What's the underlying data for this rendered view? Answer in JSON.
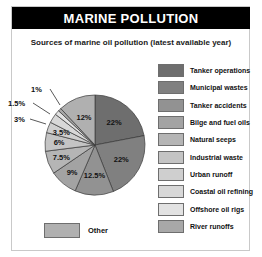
{
  "header": {
    "title": "MARINE POLLUTION"
  },
  "subtitle": "Sources of marine oil pollution (latest available year)",
  "other_legend": {
    "label": "Other",
    "color": "#b0b0b0"
  },
  "legend": {
    "items": [
      {
        "label": "Tanker operations",
        "color": "#6e6e6e"
      },
      {
        "label": "Municipal wastes",
        "color": "#808080"
      },
      {
        "label": "Tanker accidents",
        "color": "#929292"
      },
      {
        "label": "Bilge and fuel oils",
        "color": "#a3a3a3"
      },
      {
        "label": "Natural seeps",
        "color": "#b5b5b5"
      },
      {
        "label": "Industrial waste",
        "color": "#c4c4c4"
      },
      {
        "label": "Urban runoff",
        "color": "#cfcfcf"
      },
      {
        "label": "Coastal oil refining",
        "color": "#d8d8d8"
      },
      {
        "label": "Offshore oil rigs",
        "color": "#e2e2e2"
      },
      {
        "label": "River runoffs",
        "color": "#a8a8a8"
      }
    ]
  },
  "chart_data": {
    "type": "pie",
    "title": "MARINE POLLUTION",
    "subtitle": "Sources of marine oil pollution (latest available year)",
    "unit": "percent",
    "legend_position": "right",
    "start_angle_deg": 0,
    "direction": "clockwise",
    "categories": [
      "Tanker operations",
      "Municipal wastes",
      "Tanker accidents",
      "Bilge and fuel oils",
      "Natural seeps",
      "Industrial waste",
      "Urban runoff",
      "Coastal oil refining",
      "Offshore oil rigs",
      "River runoffs",
      "Other"
    ],
    "values": [
      22,
      22,
      12.5,
      9,
      7.5,
      6,
      3.5,
      3,
      1.5,
      1,
      12
    ],
    "labels": [
      "22%",
      "22%",
      "12.5%",
      "9%",
      "7.5%",
      "6%",
      "3.5%",
      "3%",
      "1.5%",
      "1%",
      "12%"
    ],
    "colors": [
      "#6e6e6e",
      "#808080",
      "#929292",
      "#a3a3a3",
      "#b5b5b5",
      "#c4c4c4",
      "#cfcfcf",
      "#d8d8d8",
      "#e2e2e2",
      "#a8a8a8",
      "#b0b0b0"
    ],
    "slices": [
      {
        "name": "Tanker operations",
        "value": 22,
        "label": "22%",
        "color": "#6e6e6e",
        "leader": false
      },
      {
        "name": "Municipal wastes",
        "value": 22,
        "label": "22%",
        "color": "#808080",
        "leader": false
      },
      {
        "name": "Tanker accidents",
        "value": 12.5,
        "label": "12.5%",
        "color": "#929292",
        "leader": false
      },
      {
        "name": "Bilge and fuel oils",
        "value": 9,
        "label": "9%",
        "color": "#a3a3a3",
        "leader": false
      },
      {
        "name": "Natural seeps",
        "value": 7.5,
        "label": "7.5%",
        "color": "#b5b5b5",
        "leader": false
      },
      {
        "name": "Industrial waste",
        "value": 6,
        "label": "6%",
        "color": "#c4c4c4",
        "leader": false
      },
      {
        "name": "Urban runoff",
        "value": 3.5,
        "label": "3.5%",
        "color": "#cfcfcf",
        "leader": false
      },
      {
        "name": "Coastal oil refining",
        "value": 3,
        "label": "3%",
        "color": "#d8d8d8",
        "leader": true
      },
      {
        "name": "Offshore oil rigs",
        "value": 1.5,
        "label": "1.5%",
        "color": "#e2e2e2",
        "leader": true
      },
      {
        "name": "River runoffs",
        "value": 1,
        "label": "1%",
        "color": "#a8a8a8",
        "leader": true
      },
      {
        "name": "Other",
        "value": 12,
        "label": "12%",
        "color": "#b0b0b0",
        "leader": false
      }
    ]
  }
}
